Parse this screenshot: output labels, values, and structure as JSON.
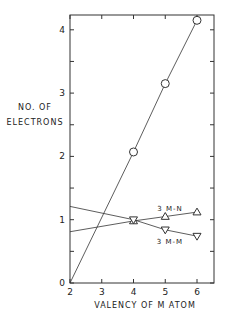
{
  "chart_data": {
    "type": "line",
    "title": "",
    "xlabel": "VALENCY OF M ATOM",
    "ylabel": "NO. OF ELECTRONS",
    "xlim": [
      2,
      6.5
    ],
    "ylim": [
      0,
      4.25
    ],
    "xticks": [
      2,
      3,
      4,
      5,
      6
    ],
    "yticks": [
      0,
      1,
      2,
      3,
      4
    ],
    "grid": false,
    "series": [
      {
        "name": "total",
        "marker": "circle",
        "x": [
          2,
          4,
          5,
          6
        ],
        "y": [
          0,
          2.07,
          3.15,
          4.15
        ],
        "marker_points": [
          [
            4,
            2.07
          ],
          [
            5,
            3.15
          ],
          [
            6,
            4.15
          ]
        ]
      },
      {
        "name": "3 M-N",
        "marker": "triangle-up",
        "x": [
          2,
          4,
          5,
          6
        ],
        "y": [
          0.81,
          0.98,
          1.05,
          1.12
        ],
        "marker_points": [
          [
            4,
            0.98
          ],
          [
            5,
            1.05
          ],
          [
            6,
            1.12
          ]
        ]
      },
      {
        "name": "3 M-M",
        "marker": "triangle-down",
        "x": [
          2,
          4,
          5,
          6
        ],
        "y": [
          1.21,
          1.0,
          0.84,
          0.74
        ],
        "marker_points": [
          [
            4,
            1.0
          ],
          [
            5,
            0.84
          ],
          [
            6,
            0.74
          ]
        ]
      }
    ],
    "annotations": [
      {
        "text": "3 M-N",
        "x": 5.0,
        "y": 1.25
      },
      {
        "text": "3 M-M",
        "x": 5.0,
        "y": 0.55
      }
    ]
  },
  "labels": {
    "ylabel_line1": "NO. OF",
    "ylabel_line2": "ELECTRONS",
    "xlabel": "VALENCY OF M ATOM",
    "mn": "3 M-N",
    "mm": "3 M-M"
  }
}
